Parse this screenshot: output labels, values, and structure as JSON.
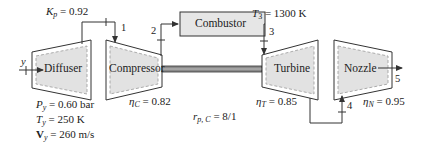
{
  "diagram": {
    "components": [
      {
        "id": "diffuser",
        "label": "Diffuser"
      },
      {
        "id": "compressor",
        "label": "Compressor"
      },
      {
        "id": "combustor",
        "label": "Combustor"
      },
      {
        "id": "turbine",
        "label": "Turbine"
      },
      {
        "id": "nozzle",
        "label": "Nozzle"
      }
    ],
    "states": {
      "inlet": "y",
      "s1": "1",
      "s2": "2",
      "s3": "3",
      "s4": "4",
      "s5": "5"
    },
    "parameters": {
      "Kp": {
        "symbol": "K",
        "sub": "p",
        "value": "= 0.92"
      },
      "T3": {
        "symbol": "T",
        "sub": "3",
        "value": "= 1300 K"
      },
      "Py": {
        "symbol": "P",
        "sub": "y",
        "value": "= 0.60 bar"
      },
      "Ty": {
        "symbol": "T",
        "sub": "y",
        "value": "= 250 K"
      },
      "Vy": {
        "symbol": "V",
        "sub": "y",
        "value": "= 260 m/s"
      },
      "etaC": {
        "symbol": "η",
        "sub": "C",
        "value": "= 0.82"
      },
      "rpC": {
        "symbol": "r",
        "sub": "p, C",
        "value": "= 8/1"
      },
      "etaT": {
        "symbol": "η",
        "sub": "T",
        "value": "= 0.85"
      },
      "etaN": {
        "symbol": "η",
        "sub": "N",
        "value": "= 0.95"
      }
    },
    "colors": {
      "line": "#333333",
      "component_fill": "#e2e2e2",
      "inner_dash": "#9a9a9a",
      "shaft_fill": "#8a8a8a"
    }
  }
}
